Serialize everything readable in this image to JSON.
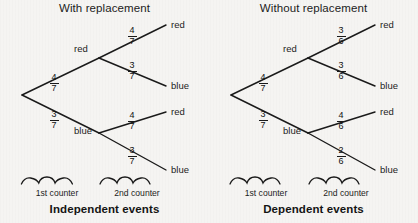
{
  "diagram": {
    "background_color": "#f5f4f2",
    "ink_color": "#1a1a1a"
  },
  "panels": [
    {
      "id": "with-replacement",
      "title": "With replacement",
      "caption": "Independent events",
      "first_level": {
        "top_branch": {
          "prob_num": "4",
          "prob_den": "7",
          "node_label": "red"
        },
        "bottom_branch": {
          "prob_num": "3",
          "prob_den": "7",
          "node_label": "blue"
        }
      },
      "second_level": [
        {
          "from": "red",
          "prob_num": "4",
          "prob_den": "7",
          "leaf_label": "red"
        },
        {
          "from": "red",
          "prob_num": "3",
          "prob_den": "7",
          "leaf_label": "blue"
        },
        {
          "from": "blue",
          "prob_num": "4",
          "prob_den": "7",
          "leaf_label": "red"
        },
        {
          "from": "blue",
          "prob_num": "3",
          "prob_den": "7",
          "leaf_label": "blue"
        }
      ],
      "braces": [
        {
          "label": "1st counter"
        },
        {
          "label": "2nd counter"
        }
      ]
    },
    {
      "id": "without-replacement",
      "title": "Without replacement",
      "caption": "Dependent events",
      "first_level": {
        "top_branch": {
          "prob_num": "4",
          "prob_den": "7",
          "node_label": "red"
        },
        "bottom_branch": {
          "prob_num": "3",
          "prob_den": "7",
          "node_label": "blue"
        }
      },
      "second_level": [
        {
          "from": "red",
          "prob_num": "3",
          "prob_den": "6",
          "leaf_label": "red"
        },
        {
          "from": "red",
          "prob_num": "3",
          "prob_den": "6",
          "leaf_label": "blue"
        },
        {
          "from": "blue",
          "prob_num": "4",
          "prob_den": "6",
          "leaf_label": "red"
        },
        {
          "from": "blue",
          "prob_num": "2",
          "prob_den": "6",
          "leaf_label": "blue"
        }
      ],
      "braces": [
        {
          "label": "1st counter"
        },
        {
          "label": "2nd counter"
        }
      ]
    }
  ]
}
